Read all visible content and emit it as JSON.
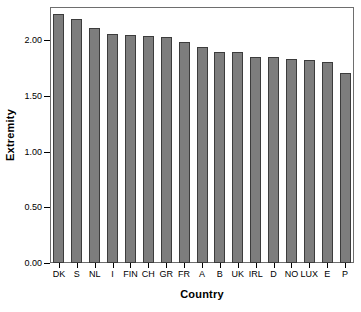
{
  "chart_data": {
    "type": "bar",
    "title": "",
    "xlabel": "Country",
    "ylabel": "Extremity",
    "categories": [
      "DK",
      "S",
      "NL",
      "I",
      "FIN",
      "CH",
      "GR",
      "FR",
      "A",
      "B",
      "UK",
      "IRL",
      "D",
      "NO",
      "LUX",
      "E",
      "P"
    ],
    "values": [
      2.24,
      2.19,
      2.11,
      2.06,
      2.05,
      2.04,
      2.03,
      1.99,
      1.94,
      1.9,
      1.9,
      1.85,
      1.85,
      1.83,
      1.82,
      1.81,
      1.71
    ],
    "ylim": [
      0.0,
      2.3
    ],
    "ytick_values": [
      0.0,
      0.5,
      1.0,
      1.5,
      2.0
    ],
    "ytick_labels": [
      "0.00",
      "0.50",
      "1.00",
      "1.50",
      "2.00"
    ],
    "grid": false,
    "legend": null,
    "bar_fill_color": "#7d7d7d",
    "bar_border_color": "#3c3c3c",
    "frame_color": "#6e6e6e",
    "background_color": "#ffffff"
  }
}
